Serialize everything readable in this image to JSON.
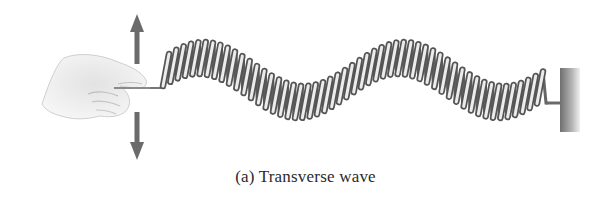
{
  "figure": {
    "caption": "(a) Transverse wave",
    "elements": {
      "hand": "hand-icon",
      "arrow_up": "arrow-up-icon",
      "arrow_down": "arrow-down-icon",
      "spring": "coiled-spring",
      "wall": "fixed-wall"
    },
    "colors": {
      "arrow": "#6b6b6b",
      "spring_dark": "#5a5a5a",
      "spring_light": "#e6e6e6",
      "wall_dark": "#7a7a7a",
      "wall_light": "#d8d8d8",
      "hand": "#e9e9e9"
    }
  }
}
